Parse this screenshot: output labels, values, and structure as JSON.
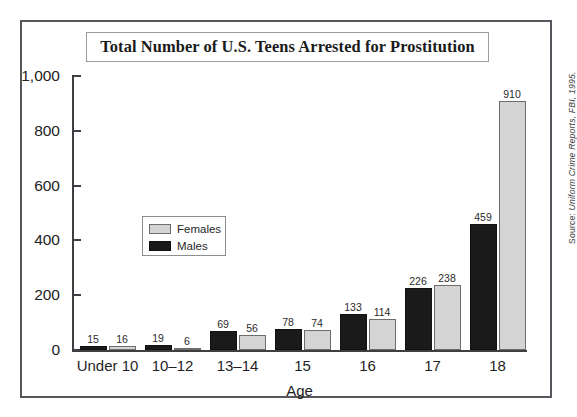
{
  "chart_data": {
    "type": "bar",
    "title": "Total Number of U.S. Teens Arrested for Prostitution",
    "xlabel": "Age",
    "ylabel": "",
    "ylim": [
      0,
      1000
    ],
    "ytick_values": [
      0,
      200,
      400,
      600,
      800,
      1000
    ],
    "ytick_labels": [
      "0",
      "200",
      "400",
      "600",
      "800",
      "1,000"
    ],
    "grid": false,
    "legend_position": "inside-center-left",
    "categories": [
      "Under 10",
      "10–12",
      "13–14",
      "15",
      "16",
      "17",
      "18"
    ],
    "series": [
      {
        "name": "Males",
        "color": "#1a1a1a",
        "values": [
          15,
          19,
          69,
          78,
          133,
          226,
          459
        ]
      },
      {
        "name": "Females",
        "color": "#d4d4d4",
        "values": [
          16,
          6,
          56,
          74,
          114,
          238,
          910
        ]
      }
    ],
    "series_draw_order": [
      "Males",
      "Females"
    ],
    "legend_order": [
      "Females",
      "Males"
    ],
    "annotations": {
      "source": "Source: Uniform Crime Reports, FBI, 1995."
    }
  },
  "figure": {
    "source_lead": "Source:",
    "source_rest": " Uniform Crime Reports, FBI, 1995."
  }
}
